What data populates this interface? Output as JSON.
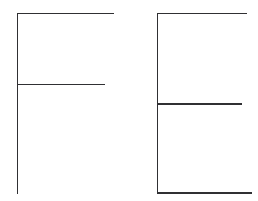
{
  "canvas": {
    "width": 258,
    "height": 201,
    "background_color": "#ffffff",
    "stroke_color": "#303033",
    "stroke_width": 1.8,
    "stroke_linecap": "butt",
    "description": "Two hand-drawn block letterforms rendered as thin dark line strokes on a plain white background."
  },
  "figures": [
    {
      "id": "letter-f",
      "name": "letter-f-glyph",
      "label": "F",
      "position": "left",
      "strokes": [
        {
          "id": "f-stem",
          "name": "vertical-stem",
          "orientation": "vertical",
          "x1": 17.5,
          "y1": 13.5,
          "x2": 17.5,
          "y2": 194.0
        },
        {
          "id": "f-top-arm",
          "name": "top-horizontal-arm",
          "orientation": "horizontal",
          "x1": 17.0,
          "y1": 13.5,
          "x2": 114.0,
          "y2": 13.5
        },
        {
          "id": "f-middle-arm",
          "name": "middle-horizontal-arm",
          "orientation": "horizontal",
          "x1": 17.0,
          "y1": 84.5,
          "x2": 105.0,
          "y2": 84.5
        }
      ]
    },
    {
      "id": "letter-e",
      "name": "letter-e-glyph",
      "label": "E",
      "position": "right",
      "strokes": [
        {
          "id": "e-stem",
          "name": "vertical-stem",
          "orientation": "vertical",
          "x1": 157.5,
          "y1": 13.5,
          "x2": 157.5,
          "y2": 193.5
        },
        {
          "id": "e-top-arm",
          "name": "top-horizontal-arm",
          "orientation": "horizontal",
          "x1": 157.0,
          "y1": 13.5,
          "x2": 247.0,
          "y2": 13.5
        },
        {
          "id": "e-middle-arm",
          "name": "middle-horizontal-arm",
          "orientation": "horizontal",
          "x1": 157.0,
          "y1": 104.0,
          "x2": 242.0,
          "y2": 104.0
        },
        {
          "id": "e-bottom-arm",
          "name": "bottom-horizontal-arm",
          "orientation": "horizontal",
          "x1": 157.0,
          "y1": 193.0,
          "x2": 252.0,
          "y2": 193.0
        }
      ]
    }
  ]
}
